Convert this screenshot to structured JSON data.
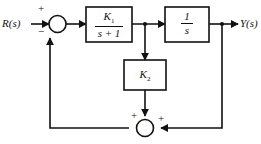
{
  "diagram": {
    "line_color": "#111111",
    "background": "#ffffff",
    "input": {
      "label": "R(s)"
    },
    "output": {
      "label": "Y(s)"
    },
    "summing_junctions": [
      {
        "id": "top-summer",
        "signs": {
          "input": "+",
          "feedback": "−"
        }
      },
      {
        "id": "bottom-summer",
        "signs": {
          "left": "+",
          "right": "+"
        }
      }
    ],
    "blocks": [
      {
        "id": "block-k1",
        "numerator": "K₁",
        "denominator": "s + 1",
        "num_base": "K",
        "num_sub": "1"
      },
      {
        "id": "block-integrator",
        "numerator": "1",
        "denominator": "s"
      },
      {
        "id": "block-k2",
        "label_base": "K",
        "label_sub": "2"
      }
    ]
  }
}
